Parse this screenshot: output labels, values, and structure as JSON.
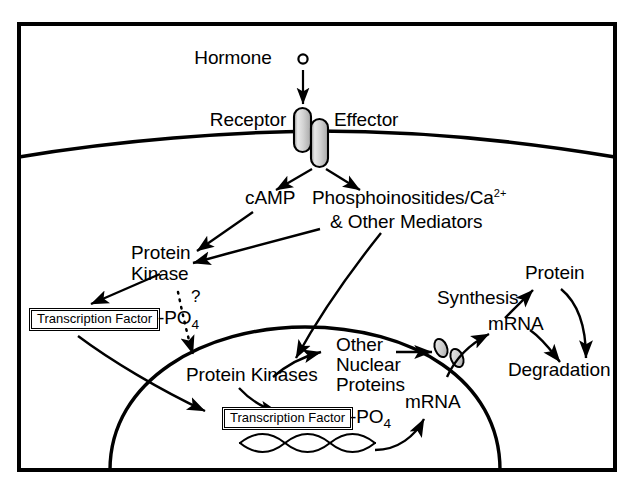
{
  "figure": {
    "type": "cell-signaling-diagram",
    "background_color": "#ffffff",
    "line_color": "#000000",
    "frame": {
      "stroke_width": 4
    }
  },
  "labels": {
    "hormone": "Hormone",
    "receptor": "Receptor",
    "effector": "Effector",
    "camp": "cAMP",
    "phosphoinositides": "Phosphoinositides/Ca",
    "phosphoinositides_sup": "2+",
    "other_mediators": "& Other Mediators",
    "protein_kinase_line1": "Protein",
    "protein_kinase_line2": "Kinase",
    "question_mark": "?",
    "transcription_factor_cyto": "Transcription Factor",
    "po4_cyto_text": "-PO",
    "po4_cyto_sub": "4",
    "protein_kinases_nuclear": "Protein Kinases",
    "other_nuclear_line1": "Other",
    "other_nuclear_line2": "Nuclear",
    "other_nuclear_line3": "Proteins",
    "transcription_factor_nuclear": "Transcription Factor",
    "po4_nuclear_text": "-PO",
    "po4_nuclear_sub": "4",
    "mrna_nuclear": "mRNA",
    "mrna_cytoplasm": "mRNA",
    "synthesis": "Synthesis",
    "protein": "Protein",
    "degradation": "Degradation"
  },
  "structures": {
    "receptor_channel": "receptor-protein",
    "effector_channel": "effector-protein",
    "hormone_ligand": "hormone-molecule",
    "cell_membrane": "plasma-membrane",
    "nuclear_envelope": "nuclear-membrane",
    "nuclear_pore": "nuclear-pore",
    "dna": "dna-double-helix"
  }
}
